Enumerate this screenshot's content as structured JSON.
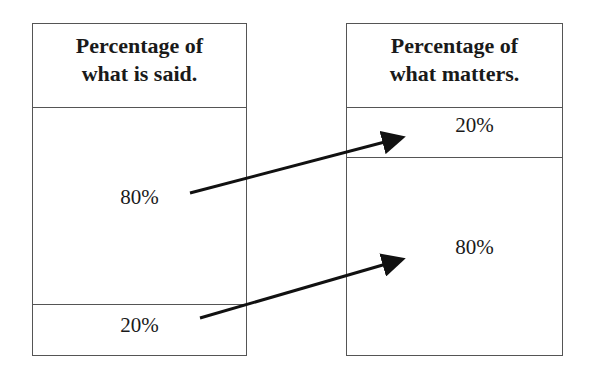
{
  "left_column": {
    "header_line1": "Percentage of",
    "header_line2": "what is said.",
    "top_value": "80%",
    "bottom_value": "20%"
  },
  "right_column": {
    "header_line1": "Percentage of",
    "header_line2": "what matters.",
    "top_value": "20%",
    "bottom_value": "80%"
  },
  "arrows": [
    {
      "from": "what is said 80%",
      "to": "what matters 20%"
    },
    {
      "from": "what is said 20%",
      "to": "what matters 80%"
    }
  ],
  "colors": {
    "border": "#555555",
    "arrow": "#111111",
    "text": "#1a1a1a"
  }
}
